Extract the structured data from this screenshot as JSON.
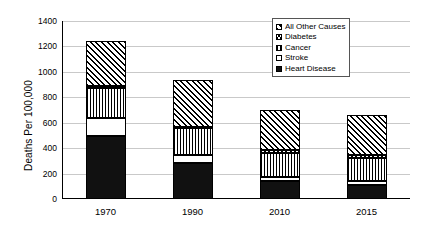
{
  "chart_data": {
    "type": "bar",
    "stacked": true,
    "title": "",
    "xlabel": "",
    "ylabel": "Deaths Per 100,000",
    "categories": [
      "1970",
      "1990",
      "2010",
      "2015"
    ],
    "ylim": [
      0,
      1400
    ],
    "ytick_step": 200,
    "yticks": [
      0,
      200,
      400,
      600,
      800,
      1000,
      1200,
      1400
    ],
    "ytick_labels": [
      "0",
      "200",
      "400",
      "600",
      "800",
      "1000",
      "1200",
      "1400"
    ],
    "grid": true,
    "legend_position": "top-right",
    "series": [
      {
        "name": "Heart Disease",
        "pattern": "solid-black",
        "values": [
          495,
          285,
          140,
          110
        ]
      },
      {
        "name": "Stroke",
        "pattern": "white",
        "values": [
          145,
          60,
          35,
          35
        ]
      },
      {
        "name": "Cancer",
        "pattern": "vertical-lines",
        "values": [
          230,
          210,
          185,
          175
        ]
      },
      {
        "name": "Diabetes",
        "pattern": "checker",
        "values": [
          20,
          15,
          25,
          25
        ]
      },
      {
        "name": "All Other Causes",
        "pattern": "diagonal-hatch",
        "values": [
          350,
          370,
          315,
          315
        ]
      }
    ],
    "totals": [
      1240,
      940,
      700,
      660
    ]
  },
  "legend": {
    "items": [
      {
        "label": "All Other Causes",
        "pattern": "diagonal-hatch"
      },
      {
        "label": "Diabetes",
        "pattern": "checker"
      },
      {
        "label": "Cancer",
        "pattern": "vertical-lines"
      },
      {
        "label": "Stroke",
        "pattern": "white"
      },
      {
        "label": "Heart Disease",
        "pattern": "solid-black"
      }
    ]
  },
  "colors": {
    "axis": "#000000",
    "gridline": "#c9c9c9",
    "background": "#ffffff",
    "bar_outline": "#000000",
    "bar_solid": "#111111"
  }
}
